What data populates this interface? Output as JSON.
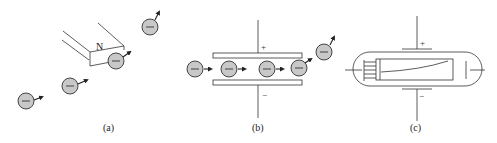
{
  "figure": {
    "panels": [
      {
        "id": "a",
        "label": "(a)",
        "magnet_label": "N",
        "description": "electrons deflected by magnet"
      },
      {
        "id": "b",
        "label": "(b)",
        "plus_sign": "+",
        "minus_sign": "−",
        "description": "electrons deflected by charged plates"
      },
      {
        "id": "c",
        "label": "(c)",
        "plus_sign": "+",
        "minus_sign": "−",
        "description": "cathode ray tube"
      }
    ],
    "electron_symbol": "−",
    "colors": {
      "electron_fill": "#c8c8c8",
      "stroke": "#333333",
      "background": "#ffffff"
    }
  }
}
